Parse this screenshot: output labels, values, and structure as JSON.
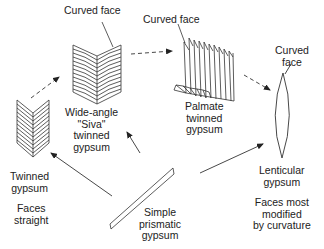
{
  "diagram": {
    "nodes": [
      {
        "id": "twinned",
        "lines": [
          "Twinned",
          "gypsum"
        ],
        "note": [
          "Faces",
          "straight"
        ]
      },
      {
        "id": "siva",
        "lines": [
          "Wide-angle",
          "\"Siva\"",
          "twinned",
          "gypsum"
        ],
        "callout": "Curved face"
      },
      {
        "id": "palmate",
        "lines": [
          "Palmate",
          "twinned",
          "gypsum"
        ],
        "callout": "Curved face"
      },
      {
        "id": "lenticular",
        "lines": [
          "Lenticular",
          "gypsum"
        ],
        "note": [
          "Faces most",
          "modified",
          "by curvature"
        ],
        "callout": [
          "Curved",
          "face"
        ]
      },
      {
        "id": "prismatic",
        "lines": [
          "Simple",
          "prismatic",
          "gypsum"
        ]
      }
    ],
    "arrows": [
      {
        "from": "prismatic",
        "to": "twinned",
        "style": "solid"
      },
      {
        "from": "prismatic",
        "to": "siva",
        "style": "solid"
      },
      {
        "from": "prismatic",
        "to": "lenticular",
        "style": "solid"
      },
      {
        "from": "twinned",
        "to": "siva",
        "style": "dashed"
      },
      {
        "from": "siva",
        "to": "palmate",
        "style": "dashed"
      },
      {
        "from": "palmate",
        "to": "lenticular",
        "style": "dashed"
      }
    ],
    "line_color": "#333333"
  }
}
